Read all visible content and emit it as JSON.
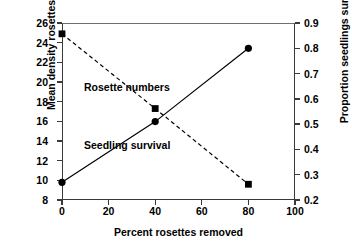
{
  "chart_data": {
    "type": "line",
    "title": "",
    "xlabel": "Percent rosettes removed",
    "ylabel": "Mean density rosettes/m",
    "ylabel_superscript": "2",
    "ylabel_right": "Proportion seedlings surviving",
    "x": [
      0,
      40,
      80
    ],
    "xlim": [
      0,
      100
    ],
    "xticks": [
      0,
      20,
      40,
      60,
      80,
      100
    ],
    "xtick_labels": [
      "0",
      "20",
      "40",
      "60",
      "80",
      "100"
    ],
    "ylim": [
      8,
      26
    ],
    "yticks": [
      8,
      10,
      12,
      14,
      16,
      18,
      20,
      22,
      24,
      26
    ],
    "ytick_labels": [
      "8",
      "10",
      "12",
      "14",
      "16",
      "18",
      "20",
      "22",
      "24",
      "26"
    ],
    "ylim_right": [
      0.2,
      0.9
    ],
    "yticks_right": [
      0.2,
      0.3,
      0.4,
      0.5,
      0.6,
      0.7,
      0.8,
      0.9
    ],
    "ytick_labels_right": [
      "0.2",
      "0.3",
      "0.4",
      "0.5",
      "0.6",
      "0.7",
      "0.8",
      "0.9"
    ],
    "grid": false,
    "legend_position": "inline-annotations",
    "series": [
      {
        "name": "Rosette numbers",
        "axis": "left",
        "marker": "square",
        "linestyle": "dashed",
        "color": "#000000",
        "values": [
          24.9,
          17.3,
          9.6
        ]
      },
      {
        "name": "Seedling survival",
        "axis": "right",
        "marker": "circle",
        "linestyle": "solid",
        "color": "#000000",
        "values": [
          0.27,
          0.51,
          0.8
        ]
      }
    ],
    "annotations": [
      {
        "text": "Rosette numbers",
        "series": "Rosette numbers"
      },
      {
        "text": "Seedling survival",
        "series": "Seedling survival"
      }
    ]
  },
  "colors": {
    "axis": "#3a3a3a",
    "marker": "#000000",
    "background": "#ffffff"
  }
}
